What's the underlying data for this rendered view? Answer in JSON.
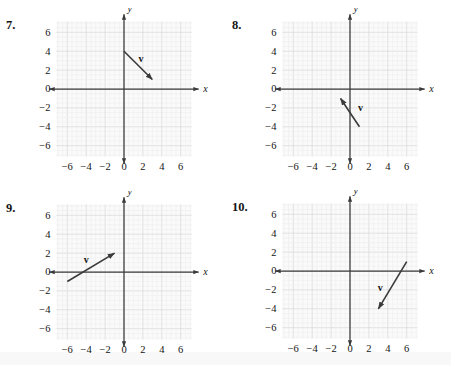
{
  "page": {
    "background": "#ffffff",
    "axis_color": "#3a3a3a",
    "grid_major_color": "#d9d9d9",
    "grid_minor_color": "#ececec",
    "grid_fill": "#fafafa",
    "vector_color": "#3a3a3a"
  },
  "axis": {
    "x_label": "x",
    "y_label": "y",
    "x_ticks": [
      "-6",
      "-4",
      "-2",
      "0",
      "2",
      "4",
      "6"
    ],
    "x_tick_values": [
      -6,
      -4,
      -2,
      0,
      2,
      4,
      6
    ],
    "y_ticks": [
      "6",
      "4",
      "2",
      "0",
      "-2",
      "-4",
      "-6"
    ],
    "y_tick_values": [
      6,
      4,
      2,
      0,
      -2,
      -4,
      -6
    ],
    "xlim": [
      -7.4,
      7.4
    ],
    "ylim": [
      -7.4,
      7.4
    ],
    "grid": true,
    "grid_minor_step": 0.5,
    "grid_major_step": 2
  },
  "chart_data": [
    {
      "type": "scatter",
      "title": "7.",
      "number": "7.",
      "xlabel": "x",
      "ylabel": "y",
      "xlim": [
        -7.4,
        7.4
      ],
      "ylim": [
        -7.4,
        7.4
      ],
      "grid": true,
      "annotations": [
        {
          "kind": "vector",
          "label": "v",
          "tail": [
            0,
            4
          ],
          "head": [
            3,
            1
          ],
          "label_pos": [
            1.8,
            2.9
          ]
        }
      ]
    },
    {
      "type": "scatter",
      "title": "8.",
      "number": "8.",
      "xlabel": "x",
      "ylabel": "y",
      "xlim": [
        -7.4,
        7.4
      ],
      "ylim": [
        -7.4,
        7.4
      ],
      "grid": true,
      "annotations": [
        {
          "kind": "vector",
          "label": "v",
          "tail": [
            1,
            -4
          ],
          "head": [
            -1,
            -1
          ],
          "label_pos": [
            1.1,
            -2.3
          ]
        }
      ]
    },
    {
      "type": "scatter",
      "title": "9.",
      "number": "9.",
      "xlabel": "x",
      "ylabel": "y",
      "xlim": [
        -7.4,
        7.4
      ],
      "ylim": [
        -7.4,
        7.4
      ],
      "grid": true,
      "annotations": [
        {
          "kind": "vector",
          "label": "v",
          "tail": [
            -6,
            -1
          ],
          "head": [
            -1,
            2
          ],
          "label_pos": [
            -4.0,
            0.9
          ]
        }
      ]
    },
    {
      "type": "scatter",
      "title": "10.",
      "number": "10.",
      "xlabel": "x",
      "ylabel": "y",
      "xlim": [
        -7.4,
        7.4
      ],
      "ylim": [
        -7.4,
        7.4
      ],
      "grid": true,
      "annotations": [
        {
          "kind": "vector",
          "label": "v",
          "tail": [
            6,
            1
          ],
          "head": [
            3,
            -4
          ],
          "label_pos": [
            3.2,
            -2.1
          ]
        }
      ]
    }
  ]
}
